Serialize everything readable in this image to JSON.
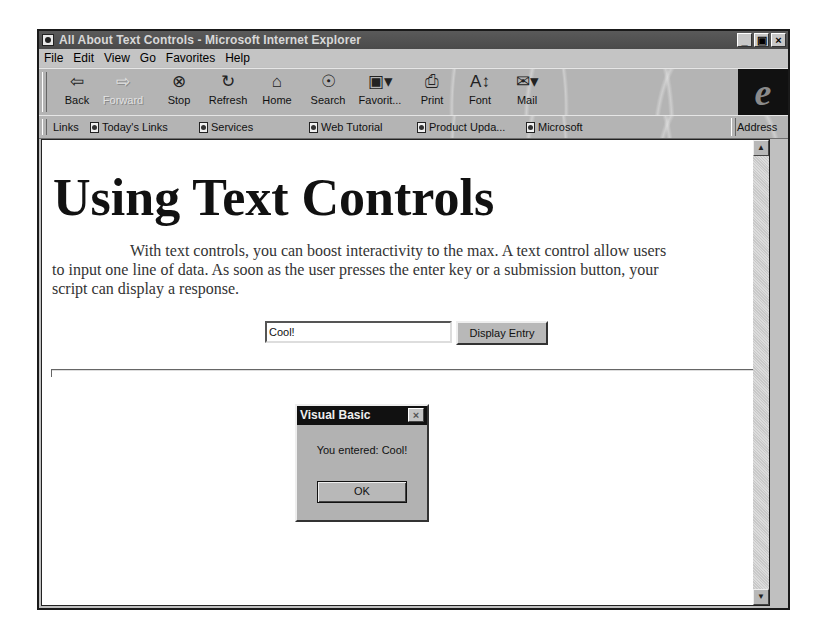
{
  "window": {
    "title": "All About Text Controls - Microsoft Internet Explorer",
    "controls": {
      "minimize": "_",
      "maximize": "▣",
      "close": "×"
    }
  },
  "menubar": {
    "items": [
      {
        "label": "File",
        "accel": "F"
      },
      {
        "label": "Edit",
        "accel": "E"
      },
      {
        "label": "View",
        "accel": "V"
      },
      {
        "label": "Go",
        "accel": "G"
      },
      {
        "label": "Favorites",
        "accel": "a"
      },
      {
        "label": "Help",
        "accel": "H"
      }
    ]
  },
  "toolbar": {
    "buttons": [
      {
        "label": "Back",
        "icon": "back-arrow-icon",
        "glyph": "⇦"
      },
      {
        "label": "Forward",
        "icon": "forward-arrow-icon",
        "glyph": "⇨",
        "disabled": true
      },
      {
        "label": "Stop",
        "icon": "stop-icon",
        "glyph": "⊗"
      },
      {
        "label": "Refresh",
        "icon": "refresh-icon",
        "glyph": "↻"
      },
      {
        "label": "Home",
        "icon": "home-icon",
        "glyph": "⌂"
      },
      {
        "label": "Search",
        "icon": "search-icon",
        "glyph": "☉"
      },
      {
        "label": "Favorit...",
        "icon": "favorites-icon",
        "glyph": "▣▾"
      },
      {
        "label": "Print",
        "icon": "print-icon",
        "glyph": "⎙"
      },
      {
        "label": "Font",
        "icon": "font-icon",
        "glyph": "A↕"
      },
      {
        "label": "Mail",
        "icon": "mail-icon",
        "glyph": "✉▾"
      }
    ],
    "logo": "e"
  },
  "linksbar": {
    "label": "Links",
    "items": [
      {
        "label": "Today's Links"
      },
      {
        "label": "Services"
      },
      {
        "label": "Web Tutorial"
      },
      {
        "label": "Product Upda..."
      },
      {
        "label": "Microsoft"
      }
    ],
    "address_label": "Address"
  },
  "page": {
    "heading": "Using Text Controls",
    "paragraph": "With text controls, you can boost interactivity to the max. A text control allow users to input one line of data. As soon as the user presses the enter key or a submission button, your script can display a response.",
    "text_field_value": "Cool!",
    "display_button_label": "Display Entry"
  },
  "dialog": {
    "title": "Visual Basic",
    "message": "You entered: Cool!",
    "ok_label": "OK",
    "close_glyph": "×"
  },
  "scrollbar": {
    "up_glyph": "▲",
    "down_glyph": "▼"
  }
}
